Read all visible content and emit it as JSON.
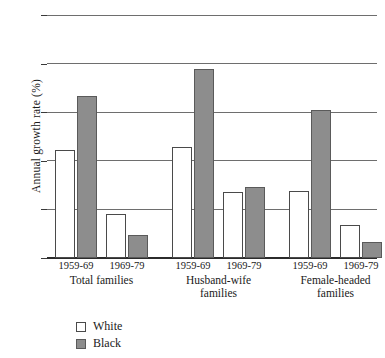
{
  "chart_data": {
    "type": "bar",
    "title": "",
    "xlabel": "",
    "ylabel": "Annual growth rate (%)",
    "ylim": [
      0,
      5
    ],
    "yticks": [
      0,
      1,
      2,
      3,
      4,
      5
    ],
    "ytick_labels": [
      "0",
      "1",
      "2",
      "3",
      "4",
      "5"
    ],
    "grid": true,
    "legend_position": "bottom-left",
    "categories": [
      "Total families 1959-69",
      "Total families 1969-79",
      "Husband-wife families 1959-69",
      "Husband-wife families 1969-79",
      "Female-headed families 1959-69",
      "Female-headed families 1969-79"
    ],
    "groups": [
      {
        "name": "Total families",
        "periods": [
          "1959-69",
          "1969-79"
        ],
        "white": [
          2.22,
          0.9
        ],
        "black": [
          3.33,
          0.47
        ]
      },
      {
        "name": "Husband-wife\nfamilies",
        "periods": [
          "1959-69",
          "1969-79"
        ],
        "white": [
          2.28,
          1.35
        ],
        "black": [
          3.89,
          1.46
        ]
      },
      {
        "name": "Female-headed\nfamilies",
        "periods": [
          "1959-69",
          "1969-79"
        ],
        "white": [
          1.37,
          0.67
        ],
        "black": [
          3.05,
          0.33
        ]
      }
    ],
    "series": [
      {
        "name": "White",
        "color": "#ffffff",
        "values": [
          2.22,
          0.9,
          2.28,
          1.35,
          1.37,
          0.67
        ]
      },
      {
        "name": "Black",
        "color": "#8d8d8d",
        "values": [
          3.33,
          0.47,
          3.89,
          1.46,
          3.05,
          0.33
        ]
      }
    ]
  },
  "legend": {
    "items": [
      {
        "label": "White",
        "swatch": "white"
      },
      {
        "label": "Black",
        "swatch": "black"
      }
    ]
  }
}
